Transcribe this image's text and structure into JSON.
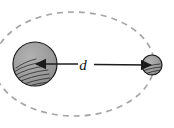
{
  "diagram": {
    "type": "orbit-separation",
    "canvas": {
      "width": 174,
      "height": 128,
      "background": "#ffffff"
    },
    "primary_body": {
      "name": "large-body",
      "cx": 35,
      "cy": 64,
      "r": 22,
      "fill": "#9b9b9b",
      "stroke": "#1c1c1c",
      "shading": "hatched-lower-left"
    },
    "secondary_body": {
      "name": "small-body",
      "cx": 152,
      "cy": 65,
      "r": 10,
      "fill": "#9b9b9b",
      "stroke": "#1c1c1c",
      "shading": "hatched-lower-left"
    },
    "separation": {
      "label": "d",
      "from_x": 35,
      "from_y": 64,
      "to_x": 152,
      "to_y": 65,
      "arrow_color": "#1c1c1c",
      "double_headed": true,
      "label_x": 85,
      "label_y": 64
    },
    "orbit": {
      "label": "dashed elliptical orbit",
      "cx": 74,
      "cy": 64,
      "rx": 80,
      "ry": 52,
      "stroke": "#a0a0a0",
      "dash": "6 5",
      "stroke_width": 1.6,
      "clipped_left": true
    }
  }
}
